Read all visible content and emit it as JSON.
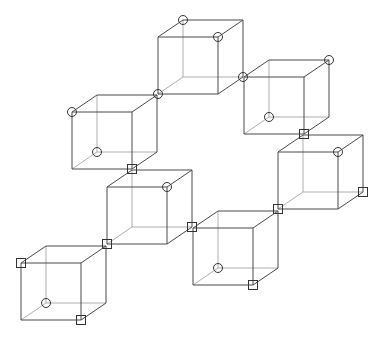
{
  "diagram": {
    "title": "",
    "colors": {
      "background": "#ffffff",
      "front_edge": "#4a4a4a",
      "back_edge": "#9a9a9a",
      "marker": "#333333"
    },
    "cube_geometry": {
      "face_width": 60,
      "face_height": 57,
      "depth_dx": 25,
      "depth_dy": -17
    },
    "vertex_names": [
      "ftl",
      "ftr",
      "fbl",
      "fbr",
      "btl",
      "btr",
      "bbl",
      "bbr"
    ],
    "cubes": [
      {
        "id": "A",
        "front_top_left": [
          158,
          37
        ],
        "markers": [
          {
            "vertex": "btl",
            "shape": "circle"
          },
          {
            "vertex": "ftr",
            "shape": "circle"
          },
          {
            "vertex": "fbl",
            "shape": "circle"
          },
          {
            "vertex": "bbr",
            "shape": "circle"
          }
        ]
      },
      {
        "id": "B",
        "front_top_left": [
          244,
          77
        ],
        "markers": [
          {
            "vertex": "btr",
            "shape": "circle"
          },
          {
            "vertex": "bbl",
            "shape": "circle"
          },
          {
            "vertex": "fbr",
            "shape": "square"
          }
        ]
      },
      {
        "id": "C",
        "front_top_left": [
          72,
          112
        ],
        "markers": [
          {
            "vertex": "ftl",
            "shape": "circle"
          },
          {
            "vertex": "bbl",
            "shape": "circle"
          },
          {
            "vertex": "fbr",
            "shape": "square"
          }
        ]
      },
      {
        "id": "D",
        "front_top_left": [
          278,
          152
        ],
        "markers": [
          {
            "vertex": "ftr",
            "shape": "circle"
          },
          {
            "vertex": "fbl",
            "shape": "square"
          },
          {
            "vertex": "bbr",
            "shape": "square"
          }
        ]
      },
      {
        "id": "E",
        "front_top_left": [
          107,
          187
        ],
        "markers": [
          {
            "vertex": "ftr",
            "shape": "circle"
          },
          {
            "vertex": "fbl",
            "shape": "square"
          },
          {
            "vertex": "bbr",
            "shape": "square"
          }
        ]
      },
      {
        "id": "F",
        "front_top_left": [
          193,
          228
        ],
        "markers": [
          {
            "vertex": "bbl",
            "shape": "circle"
          },
          {
            "vertex": "fbr",
            "shape": "square"
          }
        ]
      },
      {
        "id": "G",
        "front_top_left": [
          21,
          263
        ],
        "markers": [
          {
            "vertex": "ftl",
            "shape": "square"
          },
          {
            "vertex": "bbl",
            "shape": "circle"
          },
          {
            "vertex": "fbr",
            "shape": "square"
          }
        ]
      }
    ],
    "marker_size": {
      "circle_radius": 4.5,
      "square_half": 4.5
    }
  }
}
